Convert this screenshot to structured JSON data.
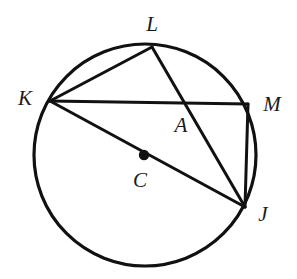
{
  "figure": {
    "kind": "circle-geometry-diagram",
    "background_color": "#ffffff",
    "stroke_color": "#111111",
    "label_color": "#1a1a1a",
    "circle": {
      "name": "circle-C",
      "center_x": 145,
      "center_y": 155,
      "radius": 111,
      "stroke_width": 3.2
    },
    "center_dot": {
      "name": "center-point-C",
      "x": 144,
      "y": 155,
      "radius": 5.2
    },
    "points": [
      {
        "id": "K",
        "name": "point-K",
        "x": 50,
        "y": 101
      },
      {
        "id": "L",
        "name": "point-L",
        "x": 152,
        "y": 47
      },
      {
        "id": "M",
        "name": "point-M",
        "x": 248,
        "y": 104
      },
      {
        "id": "J",
        "name": "point-J",
        "x": 245,
        "y": 207
      },
      {
        "id": "A",
        "name": "point-A",
        "x": 186,
        "y": 105
      },
      {
        "id": "C",
        "name": "point-C",
        "x": 144,
        "y": 155
      }
    ],
    "segments": [
      {
        "id": "KL",
        "name": "segment-KL",
        "x1": 50,
        "y1": 101,
        "x2": 152,
        "y2": 47
      },
      {
        "id": "KM",
        "name": "segment-KM",
        "x1": 50,
        "y1": 101,
        "x2": 248,
        "y2": 104
      },
      {
        "id": "KJ",
        "name": "segment-KJ-diameter",
        "x1": 50,
        "y1": 101,
        "x2": 245,
        "y2": 207
      },
      {
        "id": "LJ",
        "name": "segment-LJ",
        "x1": 152,
        "y1": 47,
        "x2": 245,
        "y2": 207
      },
      {
        "id": "MJ",
        "name": "segment-MJ",
        "x1": 248,
        "y1": 104,
        "x2": 245,
        "y2": 207
      }
    ],
    "labels": [
      {
        "id": "L",
        "name": "label-L",
        "text": "L",
        "x": 152,
        "y": 24
      },
      {
        "id": "K",
        "name": "label-K",
        "text": "K",
        "x": 25,
        "y": 98
      },
      {
        "id": "M",
        "name": "label-M",
        "text": "M",
        "x": 272,
        "y": 104
      },
      {
        "id": "A",
        "name": "label-A",
        "text": "A",
        "x": 181,
        "y": 125
      },
      {
        "id": "C",
        "name": "label-C",
        "text": "C",
        "x": 140,
        "y": 180
      },
      {
        "id": "J",
        "name": "label-J",
        "text": "J",
        "x": 263,
        "y": 214
      }
    ]
  }
}
